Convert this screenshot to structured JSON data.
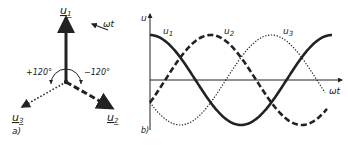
{
  "figure": {
    "panel_a": {
      "label": "a)",
      "phasors": [
        {
          "name": "u",
          "sub": "1",
          "angle_deg": 90,
          "style": "solid"
        },
        {
          "name": "u",
          "sub": "2",
          "angle_deg": -30,
          "style": "dashed"
        },
        {
          "name": "u",
          "sub": "3",
          "angle_deg": 210,
          "style": "dotted"
        }
      ],
      "rotation_label": "ωt",
      "angle_left": "+120°",
      "angle_right": "−120°"
    },
    "panel_b": {
      "label": "b)",
      "y_axis_label": "u",
      "x_axis_label": "ωt",
      "curve_labels": [
        {
          "name": "u",
          "sub": "1"
        },
        {
          "name": "u",
          "sub": "2"
        },
        {
          "name": "u",
          "sub": "3"
        }
      ]
    }
  },
  "chart_data": {
    "type": "line",
    "title": "",
    "xlabel": "ωt",
    "ylabel": "u",
    "x": [
      0,
      30,
      60,
      90,
      120,
      150,
      180,
      210,
      240,
      270,
      300,
      330,
      360,
      390
    ],
    "series": [
      {
        "name": "u1",
        "style": "solid",
        "values": [
          1.0,
          0.87,
          0.5,
          0.0,
          -0.5,
          -0.87,
          -1.0,
          -0.87,
          -0.5,
          0.0,
          0.5,
          0.87,
          1.0,
          0.87
        ]
      },
      {
        "name": "u2",
        "style": "dashed",
        "values": [
          -0.5,
          0.0,
          0.5,
          0.87,
          1.0,
          0.87,
          0.5,
          0.0,
          -0.5,
          -0.87,
          -1.0,
          -0.87,
          -0.5,
          0.0
        ]
      },
      {
        "name": "u3",
        "style": "dotted",
        "values": [
          -0.5,
          -0.87,
          -1.0,
          -0.87,
          -0.5,
          0.0,
          0.5,
          0.87,
          1.0,
          0.87,
          0.5,
          0.0,
          -0.5,
          -0.87
        ]
      }
    ],
    "ylim": [
      -1.1,
      1.1
    ],
    "grid": false,
    "legend": "inline labels"
  }
}
